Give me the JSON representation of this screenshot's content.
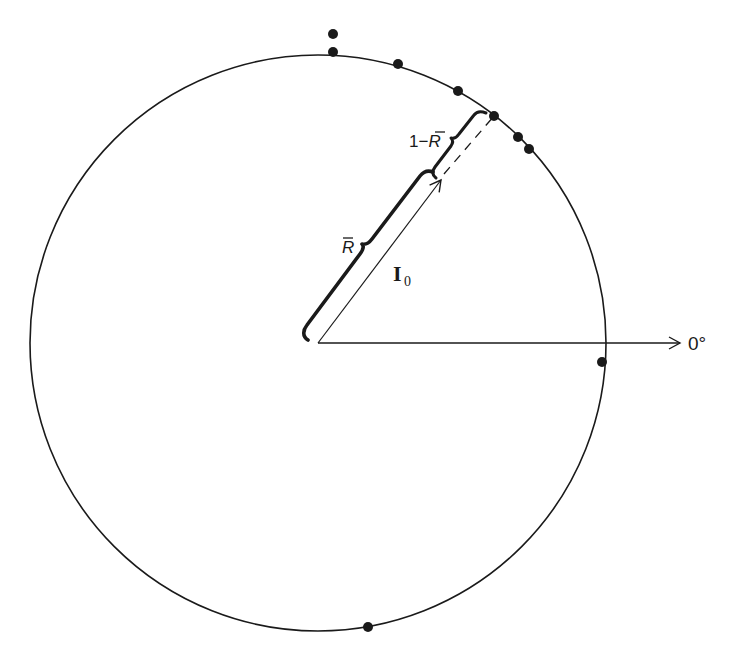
{
  "diagram": {
    "colors": {
      "ink": "#1a1a1a",
      "background": "#ffffff"
    },
    "circle": {
      "cx": 318,
      "cy": 343,
      "r": 288
    },
    "axis": {
      "label": "0°",
      "x1": 318,
      "y1": 343,
      "x2": 680,
      "y2": 343
    },
    "mean_vector": {
      "label_main": "I",
      "label_sub": "0",
      "tip": {
        "x": 441,
        "y": 180
      },
      "circle_point": {
        "x": 494,
        "y": 116
      }
    },
    "braces": {
      "r_bar": {
        "label": "R",
        "bar": "‾"
      },
      "one_minus_r_bar": {
        "label_prefix": "1−",
        "label": "R"
      }
    },
    "points": [
      {
        "x": 333,
        "y": 34,
        "note": "stacked"
      },
      {
        "x": 333,
        "y": 52
      },
      {
        "x": 398,
        "y": 64
      },
      {
        "x": 458,
        "y": 91
      },
      {
        "x": 494,
        "y": 116
      },
      {
        "x": 518,
        "y": 137
      },
      {
        "x": 529,
        "y": 149
      },
      {
        "x": 602,
        "y": 362
      },
      {
        "x": 368,
        "y": 627
      }
    ]
  }
}
